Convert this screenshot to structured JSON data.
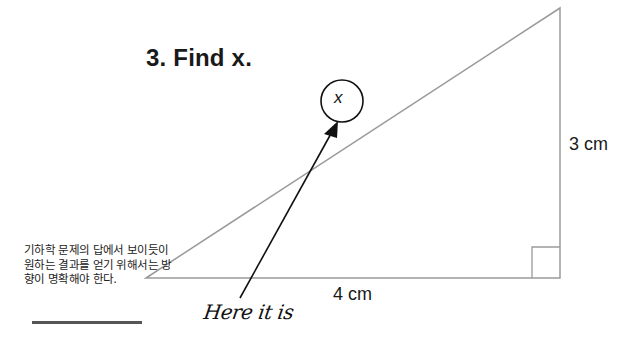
{
  "title": "3. Find x.",
  "triangle": {
    "vertical_side_label": "3 cm",
    "horizontal_side_label": "4 cm",
    "right_angle_marker": "bottom-right",
    "line_color": "#9a9a9a"
  },
  "annotation": {
    "circled_variable": "x",
    "arrow_label": "Here it is"
  },
  "caption": {
    "text": "기하학 문제의 답에서 보이듯이 원하는 결과를 얻기 위해서는 방향이 명확해야 한다."
  }
}
